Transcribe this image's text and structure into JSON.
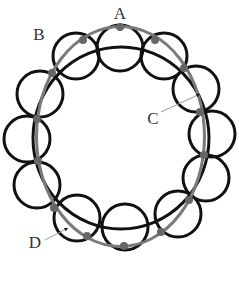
{
  "diagram": {
    "labels": [
      {
        "id": "A",
        "text": "A",
        "x": 120,
        "y": 19
      },
      {
        "id": "B",
        "text": "B",
        "x": 39,
        "y": 40
      },
      {
        "id": "C",
        "text": "C",
        "x": 153,
        "y": 124
      },
      {
        "id": "D",
        "text": "D",
        "x": 35,
        "y": 248
      }
    ],
    "colors": {
      "loops": "#111111",
      "guide_ellipse": "#7a7a7a",
      "dots": "#666666",
      "leader": "#999999"
    },
    "guide_ellipse": {
      "cx": 120.5,
      "cy": 136.5,
      "rx": 84,
      "ry": 110
    },
    "inner_ellipse": {
      "cx": 121,
      "cy": 138,
      "rx": 88,
      "ry": 91
    },
    "loops": [
      {
        "cx": 120,
        "cy": 48,
        "r": 23
      },
      {
        "cx": 164,
        "cy": 56,
        "r": 23
      },
      {
        "cx": 196,
        "cy": 89,
        "r": 23
      },
      {
        "cx": 212,
        "cy": 134,
        "r": 23
      },
      {
        "cx": 206,
        "cy": 178,
        "r": 23
      },
      {
        "cx": 178,
        "cy": 214,
        "r": 23
      },
      {
        "cx": 125,
        "cy": 227,
        "r": 23
      },
      {
        "cx": 77,
        "cy": 218,
        "r": 23
      },
      {
        "cx": 37,
        "cy": 185,
        "r": 23
      },
      {
        "cx": 27,
        "cy": 139,
        "r": 23
      },
      {
        "cx": 40,
        "cy": 94,
        "r": 23
      },
      {
        "cx": 76,
        "cy": 56,
        "r": 23
      }
    ],
    "dots": [
      {
        "x": 120,
        "y": 27
      },
      {
        "x": 83,
        "y": 40
      },
      {
        "x": 155,
        "y": 40
      },
      {
        "x": 52,
        "y": 73
      },
      {
        "x": 184,
        "y": 68
      },
      {
        "x": 37,
        "y": 119
      },
      {
        "x": 200,
        "y": 112
      },
      {
        "x": 38,
        "y": 161
      },
      {
        "x": 204,
        "y": 155
      },
      {
        "x": 54,
        "y": 208
      },
      {
        "x": 189,
        "y": 200
      },
      {
        "x": 87,
        "y": 236
      },
      {
        "x": 161,
        "y": 232
      },
      {
        "x": 124,
        "y": 246
      }
    ],
    "leaders": [
      {
        "id": "C",
        "x1": 161,
        "y1": 112,
        "x2": 200,
        "y2": 94
      },
      {
        "id": "D",
        "x1": 45,
        "y1": 240,
        "x2": 68,
        "y2": 228
      }
    ]
  }
}
